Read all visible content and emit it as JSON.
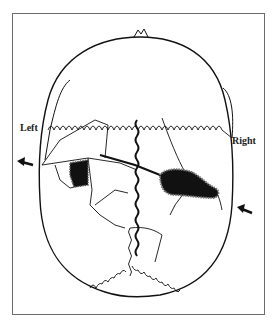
{
  "figure": {
    "type": "skull-superior-view-fracture-diagram",
    "labels": {
      "left": "Left",
      "right": "Right"
    },
    "arrows": [
      {
        "side": "left",
        "direction": "pointing-left"
      },
      {
        "side": "right",
        "direction": "pointing-left"
      }
    ],
    "colors": {
      "line": "#111111",
      "frame": "#6b6b6b",
      "background": "#ffffff"
    }
  }
}
